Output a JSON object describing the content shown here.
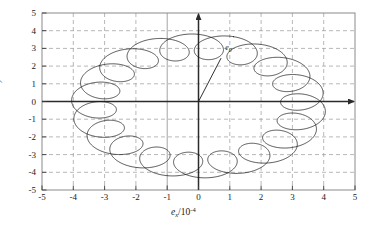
{
  "figure": {
    "kind": "scatter",
    "background": "#ffffff",
    "frame_color": "#808080",
    "axis_color": "#333333",
    "grid_color": "#999999",
    "curve_color": "#1a1a1a"
  },
  "labels": {
    "y_axis_title": "e_y/10^-4",
    "y_axis_var": "e",
    "y_axis_sub": "y",
    "y_axis_unit_base": "/10",
    "y_axis_unit_exp": "-4",
    "x_axis_title": "e_x/10^-4",
    "x_axis_var": "e",
    "x_axis_sub": "x",
    "x_axis_unit_base": "/10",
    "x_axis_unit_exp": "-4",
    "vector_label_var": "e",
    "vector_label_sub": "0"
  },
  "chart_data": {
    "type": "scatter",
    "title": "",
    "subtitle": "",
    "xlabel": "e_x/10^-4",
    "ylabel": "e_y/10^-4",
    "xlim": [
      -5,
      5
    ],
    "ylim": [
      -5,
      5
    ],
    "xticks": [
      -5,
      -4,
      -3,
      -2,
      -1,
      0,
      1,
      2,
      3,
      4,
      5
    ],
    "yticks": [
      -5,
      -4,
      -3,
      -2,
      -1,
      0,
      1,
      2,
      3,
      4,
      5
    ],
    "xtick_labels": [
      "-5",
      "-4",
      "-3",
      "-2",
      "-1",
      "0",
      "1",
      "2",
      "3",
      "4",
      "5"
    ],
    "ytick_labels": [
      "-5",
      "-4",
      "-3",
      "-2",
      "-1",
      "0",
      "1",
      "2",
      "3",
      "4",
      "5"
    ],
    "grid": true,
    "grid_style": "dashed",
    "legend": null,
    "legend_position": "none",
    "annotations": [
      {
        "text": "e_0",
        "type": "vector",
        "from_x": 0.0,
        "from_y": 0.0,
        "to_x": 0.72,
        "to_y": 2.45,
        "label_x": 0.95,
        "label_y": 3.02
      }
    ],
    "axes_arrows": {
      "x_positive": true,
      "y_positive": true
    },
    "series": [
      {
        "name": "eccentricity-trajectory",
        "curve_type": "epitrochoid",
        "description": "Closed looping trajectory (epitrochoid) traced by the eccentricity vector; roughly 19 small loops distributed around a circle of mean radius ~3.3e-4.",
        "params": {
          "R_mean": 3.35,
          "r_loop": 0.72,
          "n_loops": 19,
          "phase_deg": 74,
          "x_center": 0.0,
          "y_center": -0.25
        },
        "marker": "none",
        "linestyle": "solid",
        "linewidth": 0.8,
        "color": "#1a1a1a"
      }
    ],
    "data_extent": {
      "x_min": -3.05,
      "x_max": 2.95,
      "y_min": -4.4,
      "y_max": 4.05
    }
  },
  "geometry": {
    "plot_left": 42,
    "plot_top": 13,
    "plot_right": 355,
    "plot_bottom": 190
  }
}
